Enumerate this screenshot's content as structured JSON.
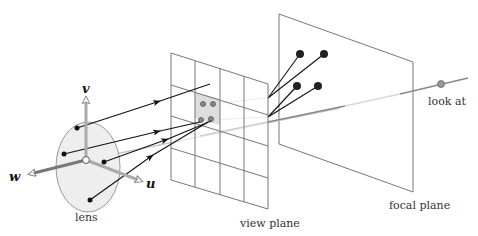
{
  "diagram": {
    "type": "thin-lens camera model",
    "labels": {
      "lens": "lens",
      "view_plane": "view plane",
      "focal_plane": "focal plane",
      "look_at": "look at"
    },
    "axes": {
      "u": "u",
      "v": "v",
      "w": "w"
    },
    "view_plane_grid": {
      "columns": 4,
      "rows": 4,
      "highlighted_cell": "row 2, column 2"
    },
    "lens_sample_points": 4,
    "view_plane_sample_points": 4,
    "focal_plane_points": 4,
    "colors": {
      "lines": "#111111",
      "plane_edges": "#777777",
      "lens_fill": "#eeeeee",
      "highlight_cell": "#dddddd",
      "axis_gray": "#aaaaaa",
      "look_at_point": "#999999"
    }
  }
}
